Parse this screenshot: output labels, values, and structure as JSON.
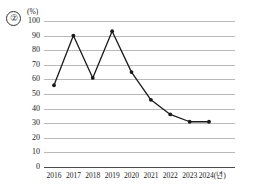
{
  "figure": {
    "item_number": "②",
    "unit_label": "(%)"
  },
  "chart_data": {
    "type": "line",
    "title": "",
    "subtitle": "",
    "xlabel": "(년)",
    "ylabel": "(%)",
    "categories": [
      "2016",
      "2017",
      "2018",
      "2019",
      "2020",
      "2021",
      "2022",
      "2023",
      "2024"
    ],
    "x_tick_labels": [
      "2016",
      "2017",
      "2018",
      "2019",
      "2020",
      "2021",
      "2022",
      "2023",
      "2024(년)"
    ],
    "values": [
      56,
      90,
      61,
      93,
      65,
      46,
      36,
      31,
      31
    ],
    "series": [
      {
        "name": "",
        "values": [
          56,
          90,
          61,
          93,
          65,
          46,
          36,
          31,
          31
        ]
      }
    ],
    "ylim": [
      0,
      100
    ],
    "y_tick_labels": [
      "100",
      "90",
      "80",
      "70",
      "60",
      "50",
      "40",
      "30",
      "20",
      "10",
      "0"
    ],
    "y_ticks": [
      100,
      90,
      80,
      70,
      60,
      50,
      40,
      30,
      20,
      10,
      0
    ],
    "y_tick_step": 10,
    "grid": true,
    "grid_axis": "y",
    "legend": false,
    "legend_position": "none",
    "marker": "filled-circle",
    "line_color": "#1a1a1a",
    "marker_color": "#1a1a1a",
    "grid_color": "#b9b9b9",
    "axis_color": "#4a4a4a",
    "background_color": "#ffffff"
  }
}
